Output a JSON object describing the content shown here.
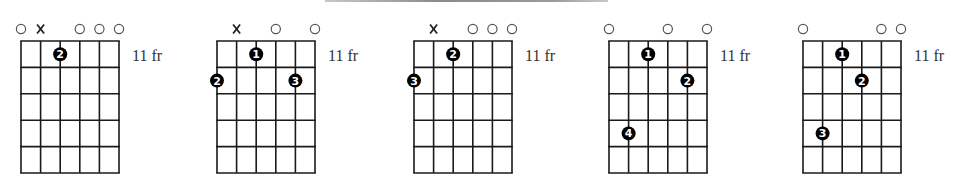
{
  "colors": {
    "grid": "#1a1a1a",
    "dot": "#000000",
    "dot_text": "#ffffff",
    "open_marker": "#555555",
    "label": "#333333"
  },
  "layout": {
    "string_spacing": 19.6,
    "fret_spacing": 26.4,
    "grid_top": 41,
    "marker_y": 29,
    "num_strings": 6,
    "num_frets": 5
  },
  "chords": [
    {
      "grid_left": 21,
      "fret_label": "11 fr",
      "markers": [
        "open",
        "mute",
        "",
        "open",
        "open",
        "open"
      ],
      "fingers": [
        {
          "string": 3,
          "fret": 1,
          "finger": "2"
        }
      ]
    },
    {
      "grid_left": 217,
      "fret_label": "11 fr",
      "markers": [
        "",
        "mute",
        "",
        "open",
        "",
        "open"
      ],
      "fingers": [
        {
          "string": 1,
          "fret": 2,
          "finger": "2"
        },
        {
          "string": 3,
          "fret": 1,
          "finger": "1"
        },
        {
          "string": 5,
          "fret": 2,
          "finger": "3"
        }
      ]
    },
    {
      "grid_left": 414,
      "fret_label": "11 fr",
      "markers": [
        "",
        "mute",
        "",
        "open",
        "open",
        "open"
      ],
      "fingers": [
        {
          "string": 1,
          "fret": 2,
          "finger": "3"
        },
        {
          "string": 3,
          "fret": 1,
          "finger": "2"
        }
      ]
    },
    {
      "grid_left": 609,
      "fret_label": "11 fr",
      "markers": [
        "open",
        "",
        "",
        "open",
        "",
        "open"
      ],
      "fingers": [
        {
          "string": 2,
          "fret": 4,
          "finger": "4"
        },
        {
          "string": 3,
          "fret": 1,
          "finger": "1"
        },
        {
          "string": 5,
          "fret": 2,
          "finger": "2"
        }
      ]
    },
    {
      "grid_left": 803,
      "fret_label": "11 fr",
      "markers": [
        "open",
        "",
        "",
        "",
        "open",
        "open"
      ],
      "fingers": [
        {
          "string": 2,
          "fret": 4,
          "finger": "3"
        },
        {
          "string": 3,
          "fret": 1,
          "finger": "1"
        },
        {
          "string": 4,
          "fret": 2,
          "finger": "2"
        }
      ]
    }
  ]
}
